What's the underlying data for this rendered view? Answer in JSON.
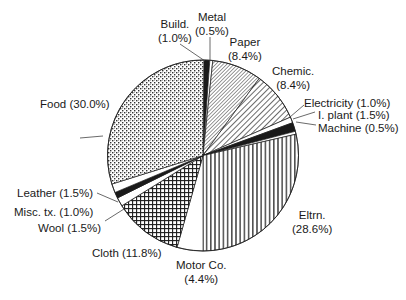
{
  "chart_data": {
    "type": "pie",
    "title": "",
    "start_angle_deg": 0.5,
    "direction": "clockwise",
    "slices": [
      {
        "name": "Build.",
        "value": 1.0,
        "label": "Build.",
        "pct": "(1.0%)",
        "pattern": "black"
      },
      {
        "name": "Metal",
        "value": 0.5,
        "label": "Metal",
        "pct": "(0.5%)",
        "pattern": "white"
      },
      {
        "name": "Paper",
        "value": 8.4,
        "label": "Paper",
        "pct": "(8.4%)",
        "pattern": "fine-diagonal"
      },
      {
        "name": "Chemic.",
        "value": 8.4,
        "label": "Chemic.",
        "pct": "(8.4%)",
        "pattern": "coarse-diagonal"
      },
      {
        "name": "Electricity",
        "value": 1.0,
        "label": "Electricity (1.0%)",
        "pct": "",
        "pattern": "white"
      },
      {
        "name": "I. plant",
        "value": 1.5,
        "label": "I. plant (1.5%)",
        "pct": "",
        "pattern": "black"
      },
      {
        "name": "Machine",
        "value": 0.5,
        "label": "Machine (0.5%)",
        "pct": "",
        "pattern": "white"
      },
      {
        "name": "Eltrn.",
        "value": 28.6,
        "label": "Eltrn.",
        "pct": "(28.6%)",
        "pattern": "vertical"
      },
      {
        "name": "Motor Co.",
        "value": 4.4,
        "label": "Motor Co.",
        "pct": "(4.4%)",
        "pattern": "white"
      },
      {
        "name": "Cloth",
        "value": 11.8,
        "label": "Cloth (11.8%)",
        "pct": "",
        "pattern": "grid"
      },
      {
        "name": "Wool",
        "value": 1.5,
        "label": "Wool (1.5%)",
        "pct": "",
        "pattern": "white"
      },
      {
        "name": "Misc. tx.",
        "value": 1.0,
        "label": "Misc. tx. (1.0%)",
        "pct": "",
        "pattern": "black"
      },
      {
        "name": "Leather",
        "value": 1.5,
        "label": "Leather (1.5%)",
        "pct": "",
        "pattern": "white"
      },
      {
        "name": "Food",
        "value": 30.0,
        "label": "Food (30.0%)",
        "pct": "",
        "pattern": "dots"
      }
    ],
    "categories": [
      "Build.",
      "Metal",
      "Paper",
      "Chemic.",
      "Electricity",
      "I. plant",
      "Machine",
      "Eltrn.",
      "Motor Co.",
      "Cloth",
      "Wool",
      "Misc. tx.",
      "Leather",
      "Food"
    ],
    "values": [
      1.0,
      0.5,
      8.4,
      8.4,
      1.0,
      1.5,
      0.5,
      28.6,
      4.4,
      11.8,
      1.5,
      1.0,
      1.5,
      30.0
    ],
    "unit": "%",
    "legend": "none (direct labels with leader lines)"
  },
  "labels": {
    "build": {
      "name": "Build.",
      "pct": "(1.0%)"
    },
    "metal": {
      "name": "Metal",
      "pct": "(0.5%)"
    },
    "paper": {
      "name": "Paper",
      "pct": "(8.4%)"
    },
    "chemic": {
      "name": "Chemic.",
      "pct": "(8.4%)"
    },
    "electricity": "Electricity (1.0%)",
    "iplant": "I. plant (1.5%)",
    "machine": "Machine (0.5%)",
    "eltrn": {
      "name": "Eltrn.",
      "pct": "(28.6%)"
    },
    "motor": {
      "name": "Motor Co.",
      "pct": "(4.4%)"
    },
    "cloth": "Cloth (11.8%)",
    "wool": "Wool (1.5%)",
    "misc": "Misc. tx. (1.0%)",
    "leather": "Leather (1.5%)",
    "food": "Food (30.0%)"
  },
  "colors": {
    "ink": "#1a1a1a",
    "background": "#ffffff"
  }
}
